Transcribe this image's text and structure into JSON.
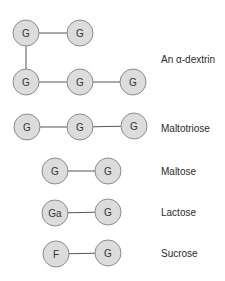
{
  "style": {
    "node_fill": "#dcdcdc",
    "node_stroke": "#8c8c8c",
    "edge_color": "#555555",
    "text_color": "#333333"
  },
  "diagram": {
    "molecules": [
      {
        "label": "An α-dextrin",
        "label_pos": [
          161,
          59
        ],
        "nodes": [
          {
            "text": "G",
            "x": 26,
            "y": 33
          },
          {
            "text": "G",
            "x": 80,
            "y": 33
          },
          {
            "text": "G",
            "x": 26,
            "y": 82
          },
          {
            "text": "G",
            "x": 80,
            "y": 82
          },
          {
            "text": "G",
            "x": 133,
            "y": 82
          }
        ],
        "edges": [
          [
            0,
            1
          ],
          [
            0,
            2
          ],
          [
            2,
            3
          ],
          [
            3,
            4
          ]
        ]
      },
      {
        "label": "Maltotriose",
        "label_pos": [
          161,
          128
        ],
        "nodes": [
          {
            "text": "G",
            "x": 27,
            "y": 127
          },
          {
            "text": "G",
            "x": 80,
            "y": 127
          },
          {
            "text": "G",
            "x": 134,
            "y": 126
          }
        ],
        "edges": [
          [
            0,
            1
          ],
          [
            1,
            2
          ]
        ]
      },
      {
        "label": "Maltose",
        "label_pos": [
          161,
          171
        ],
        "nodes": [
          {
            "text": "G",
            "x": 55,
            "y": 171
          },
          {
            "text": "G",
            "x": 108,
            "y": 171
          }
        ],
        "edges": [
          [
            0,
            1
          ]
        ]
      },
      {
        "label": "Lactose",
        "label_pos": [
          161,
          212
        ],
        "nodes": [
          {
            "text": "Ga",
            "x": 55,
            "y": 213
          },
          {
            "text": "G",
            "x": 108,
            "y": 212
          }
        ],
        "edges": [
          [
            0,
            1
          ]
        ]
      },
      {
        "label": "Sucrose",
        "label_pos": [
          161,
          253
        ],
        "nodes": [
          {
            "text": "F",
            "x": 56,
            "y": 254
          },
          {
            "text": "G",
            "x": 108,
            "y": 253
          }
        ],
        "edges": [
          [
            0,
            1
          ]
        ]
      }
    ]
  }
}
